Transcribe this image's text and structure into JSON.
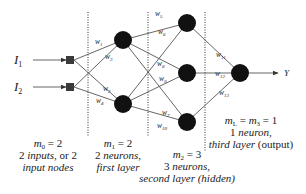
{
  "diagram": {
    "inputs": [
      {
        "label": "I",
        "subscript": "1"
      },
      {
        "label": "I",
        "subscript": "2"
      }
    ],
    "output": {
      "label": "Y"
    },
    "layers": [
      {
        "id": "input",
        "neurons": 2
      },
      {
        "id": "first",
        "neurons": 2
      },
      {
        "id": "second",
        "neurons": 3
      },
      {
        "id": "third",
        "neurons": 1
      }
    ],
    "weights": [
      {
        "label": "w",
        "subscript": "1"
      },
      {
        "label": "w",
        "subscript": "3"
      },
      {
        "label": "w",
        "subscript": "2"
      },
      {
        "label": "w",
        "subscript": "4"
      },
      {
        "label": "w",
        "subscript": "5"
      },
      {
        "label": "w",
        "subscript": "6"
      },
      {
        "label": "w",
        "subscript": "8"
      },
      {
        "label": "w",
        "subscript": "9"
      },
      {
        "label": "w",
        "subscript": "7"
      },
      {
        "label": "w",
        "subscript": "10"
      },
      {
        "label": "w",
        "subscript": "11"
      },
      {
        "label": "w",
        "subscript": "12"
      },
      {
        "label": "w",
        "subscript": "13"
      }
    ],
    "captions": {
      "input": {
        "line1_var": "m",
        "line1_sub": "0",
        "line1_rest": " = 2",
        "line2_a": "2 ",
        "line2_b": "inputs",
        "line2_c": ", or 2",
        "line3": "input nodes"
      },
      "first": {
        "line1_var": "m",
        "line1_sub": "1",
        "line1_rest": " = 2",
        "line2_a": "2 ",
        "line2_b": "neurons,",
        "line3": "first layer"
      },
      "second": {
        "line1_var": "m",
        "line1_sub": "2",
        "line1_rest": " = 3",
        "line2_a": "3 ",
        "line2_b": "neurons,",
        "line3_a": "second layer ",
        "line3_b": "(hidden)"
      },
      "third": {
        "line1_var1": "m",
        "line1_sub1": "L",
        "line1_mid": " = ",
        "line1_var2": "m",
        "line1_sub2": "3",
        "line1_rest": " = 1",
        "line2_a": "1 ",
        "line2_b": "neuron,",
        "line3_a": "third layer ",
        "line3_b": "(output)"
      }
    }
  }
}
